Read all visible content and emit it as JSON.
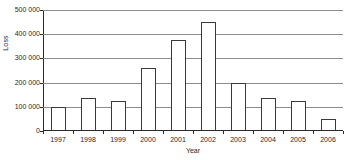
{
  "chart_data": {
    "type": "bar",
    "title": "",
    "xlabel": "Year",
    "ylabel": "Loss",
    "categories": [
      "1997",
      "1998",
      "1999",
      "2000",
      "2001",
      "2002",
      "2003",
      "2004",
      "2005",
      "2006"
    ],
    "values": [
      100000,
      137000,
      122000,
      262000,
      375000,
      450000,
      197000,
      137000,
      125000,
      50000
    ],
    "ylim": [
      0,
      500000
    ],
    "yticks": [
      0,
      100000,
      200000,
      300000,
      400000,
      500000
    ],
    "ytick_labels": [
      "0",
      "100 000",
      "200 000",
      "300 000",
      "400 000",
      "500 000"
    ],
    "grid": true,
    "legend": false,
    "bar_fill_color": "#ffffff",
    "bar_edge_color": "#3a3a3a",
    "gridline_color": "#8d8d8d",
    "axis_color": "#2b2b2b"
  }
}
